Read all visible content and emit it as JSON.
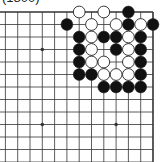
{
  "caption": "(1800)",
  "board": {
    "size_visible": {
      "cols": 13,
      "rows": 13
    },
    "edges": [
      "top",
      "right"
    ],
    "origin": {
      "x": 153,
      "y": 12
    },
    "spacing": {
      "x": 12.3,
      "y": 12.5
    },
    "colors": {
      "line": "#333333",
      "black": "#111111",
      "white": "#ffffff",
      "stone_outline": "#222222"
    },
    "star_points": [
      {
        "c": 3,
        "r": 9
      },
      {
        "c": 9,
        "r": 3
      },
      {
        "c": 9,
        "r": 9
      }
    ],
    "stones": [
      {
        "color": "white",
        "c": 6,
        "r": 0
      },
      {
        "color": "white",
        "c": 4,
        "r": 0
      },
      {
        "color": "black",
        "c": 2,
        "r": 0
      },
      {
        "color": "black",
        "c": 7,
        "r": 1
      },
      {
        "color": "white",
        "c": 5,
        "r": 1
      },
      {
        "color": "white",
        "c": 3,
        "r": 1
      },
      {
        "color": "black",
        "c": 2,
        "r": 1
      },
      {
        "color": "white",
        "c": 1,
        "r": 1
      },
      {
        "color": "black",
        "c": 0,
        "r": 1
      },
      {
        "color": "black",
        "c": 6,
        "r": 2
      },
      {
        "color": "white",
        "c": 5,
        "r": 2
      },
      {
        "color": "black",
        "c": 4,
        "r": 2
      },
      {
        "color": "black",
        "c": 3,
        "r": 2
      },
      {
        "color": "white",
        "c": 2,
        "r": 2
      },
      {
        "color": "black",
        "c": 1,
        "r": 2
      },
      {
        "color": "black",
        "c": 6,
        "r": 3
      },
      {
        "color": "white",
        "c": 5,
        "r": 3
      },
      {
        "color": "black",
        "c": 3,
        "r": 3
      },
      {
        "color": "white",
        "c": 2,
        "r": 3
      },
      {
        "color": "black",
        "c": 1,
        "r": 3
      },
      {
        "color": "black",
        "c": 6,
        "r": 4
      },
      {
        "color": "white",
        "c": 5,
        "r": 4
      },
      {
        "color": "white",
        "c": 4,
        "r": 4
      },
      {
        "color": "white",
        "c": 2,
        "r": 4
      },
      {
        "color": "black",
        "c": 1,
        "r": 4
      },
      {
        "color": "black",
        "c": 6,
        "r": 5
      },
      {
        "color": "black",
        "c": 5,
        "r": 5
      },
      {
        "color": "white",
        "c": 4,
        "r": 5
      },
      {
        "color": "white",
        "c": 3,
        "r": 5
      },
      {
        "color": "white",
        "c": 2,
        "r": 5
      },
      {
        "color": "black",
        "c": 1,
        "r": 5
      },
      {
        "color": "black",
        "c": 4,
        "r": 6
      },
      {
        "color": "black",
        "c": 3,
        "r": 6
      },
      {
        "color": "black",
        "c": 2,
        "r": 6
      },
      {
        "color": "black",
        "c": 1,
        "r": 6
      }
    ]
  }
}
